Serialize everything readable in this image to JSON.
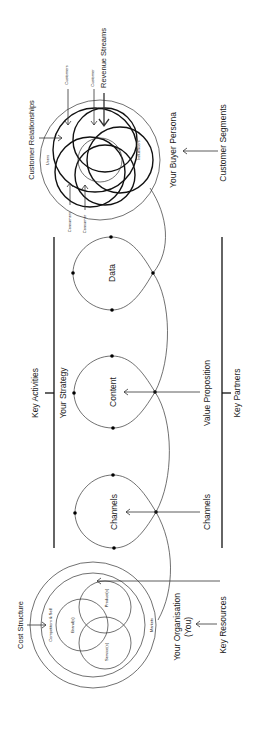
{
  "diagram": {
    "orientation": "rotated-90-ccw",
    "persona": {
      "title": "Your Buyer Persona",
      "pointer_label": "Customer Segments",
      "callouts": {
        "customer_relationships": "Customer Relationships",
        "customers": "Customers",
        "customer": "Customer",
        "revenue_streams": "Revenue Streams",
        "consumers": "Consumers",
        "consumer": "Consumer"
      },
      "inner_labels": {
        "users": "Users",
        "influencers": "Influencers"
      }
    },
    "strategy": {
      "title": "Your Strategy",
      "top_bar_label": "Key Activities",
      "bottom_bar_label": "Key Partners",
      "loops": [
        {
          "label": "Data",
          "pointer_label": ""
        },
        {
          "label": "Content",
          "pointer_label": "Value Proposition"
        },
        {
          "label": "Channels",
          "pointer_label": "Channels"
        }
      ]
    },
    "organisation": {
      "title_line1": "Your Organisation",
      "title_line2": "(You)",
      "pointer_label": "Key Resources",
      "cost_label": "Cost Structure",
      "ring_labels": {
        "outer": "Competitors & Self",
        "markets": "Markets"
      },
      "venn": {
        "brands": "Brand(s)",
        "products": "Product(s)",
        "services": "Service(s)"
      }
    },
    "colors": {
      "line": "#333333",
      "text": "#222222",
      "background": "#ffffff"
    }
  }
}
